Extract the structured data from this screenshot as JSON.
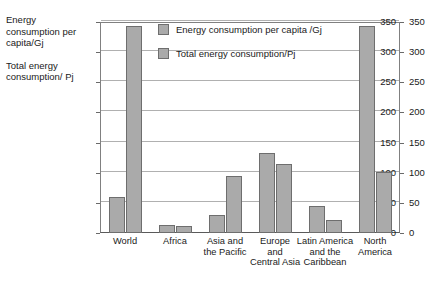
{
  "axis_captions": [
    "Energy consumption per capita/Gj",
    "Total energy consumption/ Pj"
  ],
  "legend": {
    "position": "top-center-inside",
    "items": [
      {
        "label": "Energy consumption per capita /Gj",
        "swatch_name": "legend-swatch-per-capita"
      },
      {
        "label": "Total energy consumption/Pj",
        "swatch_name": "legend-swatch-total"
      }
    ]
  },
  "colors": {
    "bar_fill": "#aaaaaa",
    "bar_border": "#6e6e6e",
    "gridline": "#b0b0b0",
    "axis": "#808080",
    "text": "#1a1a1a",
    "background": "#ffffff"
  },
  "chart_data": {
    "type": "bar",
    "title": "",
    "xlabel": "",
    "ylabel": "Energy consumption per capita/Gj; Total energy consumption/ Pj",
    "ylim": [
      0,
      350
    ],
    "yticks": [
      0,
      50,
      100,
      150,
      200,
      250,
      300,
      350
    ],
    "tick_labels": [
      "0",
      "50",
      "100",
      "150",
      "200",
      "250",
      "300",
      "350"
    ],
    "grid": true,
    "dual_axis": true,
    "right_axis_ticks": [
      0,
      50,
      100,
      150,
      200,
      250,
      300,
      350
    ],
    "right_axis_tick_labels": [
      "0",
      "50",
      "100",
      "150",
      "200",
      "250",
      "300",
      "350"
    ],
    "categories": [
      "World",
      "Africa",
      "Asia and the Pacific",
      "Europe and Central Asia",
      "Latin America and the Caribbean",
      "North America"
    ],
    "category_lines": [
      [
        "World"
      ],
      [
        "Africa"
      ],
      [
        "Asia and",
        "the Pacific"
      ],
      [
        "Europe",
        "and",
        "Central Asia"
      ],
      [
        "Latin America",
        "and the",
        "Caribbean"
      ],
      [
        "North",
        "America"
      ]
    ],
    "series": [
      {
        "name": "Energy consumption per capita /Gj",
        "values": [
          60,
          13,
          30,
          133,
          44,
          344
        ]
      },
      {
        "name": "Total energy consumption/Pj",
        "values": [
          344,
          11,
          94,
          115,
          21,
          102
        ]
      }
    ]
  }
}
